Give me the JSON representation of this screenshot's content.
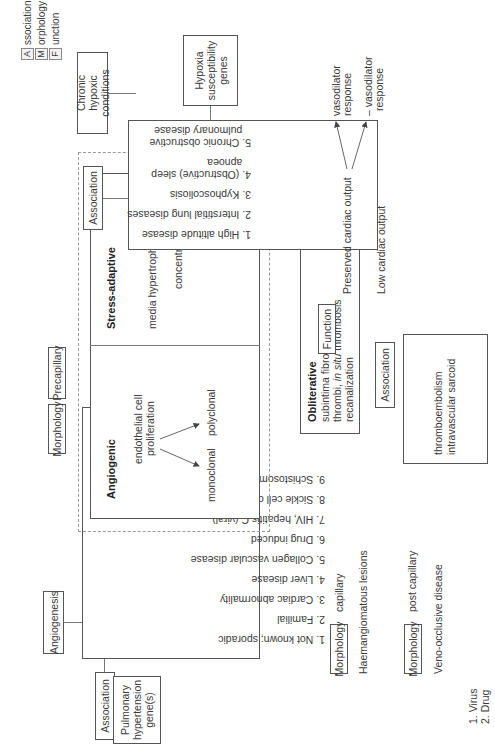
{
  "legend": {
    "items": [
      {
        "key": "A",
        "rest": "ssociation"
      },
      {
        "key": "M",
        "rest": "orphology"
      },
      {
        "key": "F",
        "rest": "unction"
      }
    ]
  },
  "left_branch": {
    "angiogenesis_label": "Angiogenesis",
    "association_label": "Association",
    "genes_label": "Pulmonary hypertension gene(s)",
    "conditions": [
      "1. Not known; sporadic",
      "2. Familial",
      "3. Cardiac abnormality",
      "4. Liver disease",
      "5. Collagen vascular disease",
      "6. Drug induced",
      "7. HIV, hepatitis C (viral)",
      "8. Sickle cell disease",
      "9. Schistosoma"
    ]
  },
  "right_branch": {
    "chronic_label": "Chronic hypoxic conditions",
    "association_label": "Association",
    "hypoxia_genes_label": "Hypoxia susceptibility genes",
    "conditions": [
      "1. High altitude disease",
      "2. Interstitial lung diseases",
      "3. Kyphoscoliosis",
      "4. (Obstructive) sleep",
      "   apnoea",
      "5. Chronic obstructive",
      "   pulmonary disease"
    ]
  },
  "center": {
    "morphology_label": "Morphology",
    "precapillary_label": "Precapillary",
    "angiogenic": {
      "title": "Angiogenic",
      "line1": "endothelial cell",
      "line2": "proliferation",
      "monoclonal": "monoclonal",
      "polyclonal": "polyclonal"
    },
    "stress_adaptive": {
      "title": "Stress-adaptive",
      "line1": "media hypertrophy",
      "line2": "concentric"
    },
    "obliterative": {
      "title": "Obliterative",
      "line1": "subintima fibrosis",
      "line2_pre": "thrombi, ",
      "line2_italic": "in situ",
      "line2_post": " thrombosis",
      "line3": "recanalization"
    },
    "association_label": "Association",
    "association_items": [
      "thromboembolism",
      "intravascular sarcoid"
    ]
  },
  "function": {
    "label": "Function",
    "preserved": "Preserved cardiac output",
    "low": "Low cardiac output",
    "plus_response_1": "vasodilator",
    "plus_response_2": "response",
    "minus_response_1": "– vasodilator",
    "minus_response_2": "response"
  },
  "capillary": {
    "morphology_label": "Morphology",
    "type": "capillary",
    "lesion": "Haemangiomatous lesions"
  },
  "post_capillary": {
    "morphology_label": "Morphology",
    "type": "post capillary",
    "disease": "Veno-occlusive disease",
    "causes": [
      "1. Virus",
      "2. Drug"
    ]
  }
}
